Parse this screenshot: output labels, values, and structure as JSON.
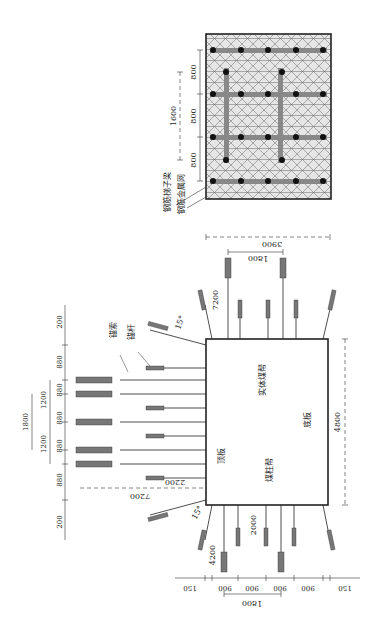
{
  "diagram": {
    "colors": {
      "line": "#222222",
      "bar": "#777777",
      "mesh_bg": "#e6e6e6",
      "mesh_line": "#666666",
      "dot": "#111111",
      "dim": "#333333"
    },
    "labels": {
      "anchor_cable": "锚索",
      "anchor_bolt": "锚杆",
      "roof": "顶板",
      "floor": "底板",
      "solid_coal_side": "实体煤帮",
      "coal_pillar_side": "煤柱帮",
      "ladder_beam": "钢筋梯子梁",
      "metal_mesh": "钢筋金属网",
      "angle_top": "15°",
      "angle_bottom": "15°"
    },
    "dimensions": {
      "roadway_width": "4800",
      "roadway_height": "3900",
      "cable_length_roof": "7200",
      "bolt_length_roof": "2200",
      "cable_length_side_right": "7200",
      "cable_spacing_side_right": "1800",
      "cable_length_side_left": "4200",
      "bolt_length_side_left": "2000",
      "cable_spacing_side_left": "1800",
      "roof_spacings": [
        "200",
        "880",
        "880",
        "880",
        "880",
        "880",
        "200"
      ],
      "roof_cable_spacings": [
        "1200",
        "1200"
      ],
      "roof_cable_group": "1800",
      "side_spacings": [
        "150",
        "900",
        "900",
        "900",
        "900",
        "150"
      ],
      "mesh_spacings": [
        "800",
        "800",
        "800"
      ],
      "mesh_group": "1600"
    }
  }
}
